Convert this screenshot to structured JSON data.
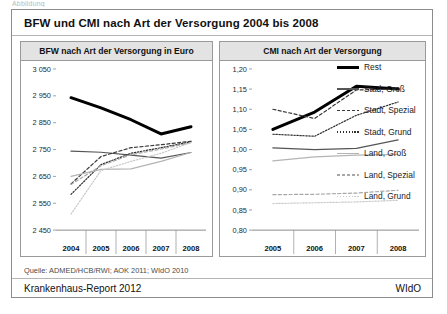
{
  "crop_caption": "Abbildung",
  "figure": {
    "title": "BFW und CMI nach Art der Versorgung 2004 bis 2008",
    "source": "Quelle: ADMED/HCB/RWI; AOK 2011; WIdO 2010",
    "footer_left": "Krankenhaus-Report 2012",
    "footer_right": "WIdO"
  },
  "legend": {
    "position": "right",
    "items": [
      {
        "label": "Rest",
        "color": "#000000",
        "style": "solid",
        "width": 3.0
      },
      {
        "label": "Stad, Groß",
        "color": "#555555",
        "style": "solid",
        "width": 1.2
      },
      {
        "label": "Stadt, Spezial",
        "color": "#3a3a3a",
        "style": "dashed",
        "width": 1.2
      },
      {
        "label": "Stadt, Grund",
        "color": "#2e2e2e",
        "style": "dotted",
        "width": 1.2
      },
      {
        "label": "Land, Groß",
        "color": "#b4b4b4",
        "style": "solid",
        "width": 1.2
      },
      {
        "label": "Land, Spezial",
        "color": "#a8a8a8",
        "style": "dashed",
        "width": 1.2
      },
      {
        "label": "Land, Grund",
        "color": "#c9c9c9",
        "style": "dotted",
        "width": 1.2
      }
    ]
  },
  "chart_data": [
    {
      "id": "bfw",
      "type": "line",
      "title": "BFW nach Art der Versorgung in Euro",
      "xlabel": "",
      "ylabel": "",
      "categories": [
        "2004",
        "2005",
        "2006",
        "2007",
        "2008"
      ],
      "ylim": [
        2450,
        3050
      ],
      "ytick_step": 100,
      "ytick_labels": [
        "2 450",
        "2 550",
        "2 650",
        "2 750",
        "2 850",
        "2 950",
        "3 050"
      ],
      "grid": false,
      "series": [
        {
          "name": "Rest",
          "values": [
            2943,
            2905,
            2861,
            2808,
            2835
          ]
        },
        {
          "name": "Stad, Groß",
          "values": [
            2744,
            2740,
            2729,
            2718,
            2739
          ]
        },
        {
          "name": "Stadt, Spezial",
          "values": [
            2622,
            2724,
            2757,
            2768,
            2781
          ]
        },
        {
          "name": "Stadt, Grund",
          "values": [
            2583,
            2694,
            2736,
            2757,
            2779
          ]
        },
        {
          "name": "Land, Groß",
          "values": [
            2650,
            2676,
            2678,
            2706,
            2739
          ]
        },
        {
          "name": "Land, Spezial",
          "values": [
            2620,
            2690,
            2731,
            2752,
            2775
          ]
        },
        {
          "name": "Land, Grund",
          "values": [
            2510,
            2672,
            2706,
            2736,
            2776
          ]
        }
      ]
    },
    {
      "id": "cmi",
      "type": "line",
      "title": "CMI nach Art der Versorgung",
      "xlabel": "",
      "ylabel": "",
      "categories": [
        "2005",
        "2006",
        "2007",
        "2008"
      ],
      "ylim": [
        0.8,
        1.2
      ],
      "ytick_step": 0.05,
      "ytick_labels": [
        "0,80",
        "0,85",
        "0,90",
        "0,95",
        "1,00",
        "1,05",
        "1,10",
        "1,15",
        "1,20"
      ],
      "grid": false,
      "series": [
        {
          "name": "Rest",
          "values": [
            1.05,
            1.093,
            1.157,
            1.15
          ]
        },
        {
          "name": "Stad, Groß",
          "values": [
            1.004,
            1.0,
            1.003,
            1.024
          ]
        },
        {
          "name": "Stadt, Spezial",
          "values": [
            1.1,
            1.077,
            1.148,
            1.15
          ]
        },
        {
          "name": "Stadt, Grund",
          "values": [
            1.038,
            1.033,
            1.085,
            1.118
          ]
        },
        {
          "name": "Land, Groß",
          "values": [
            0.972,
            0.982,
            0.986,
            0.988
          ]
        },
        {
          "name": "Land, Spezial",
          "values": [
            0.888,
            0.889,
            0.892,
            0.899
          ]
        },
        {
          "name": "Land, Grund",
          "values": [
            0.866,
            0.868,
            0.87,
            0.874
          ]
        }
      ]
    }
  ]
}
